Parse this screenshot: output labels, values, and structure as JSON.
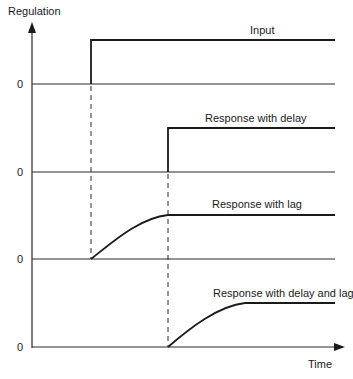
{
  "diagram": {
    "y_axis_label": "Regulation",
    "x_axis_label": "Time",
    "zero_label": "0",
    "panels": [
      {
        "label": "Input",
        "zero": "0",
        "shape": "step"
      },
      {
        "label": "Response with delay",
        "zero": "0",
        "shape": "delayed-step"
      },
      {
        "label": "Response with lag",
        "zero": "0",
        "shape": "lag-curve"
      },
      {
        "label": "Response with delay and lag",
        "zero": "0",
        "shape": "delayed-lag-curve"
      }
    ],
    "colors": {
      "line": "#1a1a1a",
      "background": "#ffffff"
    }
  }
}
